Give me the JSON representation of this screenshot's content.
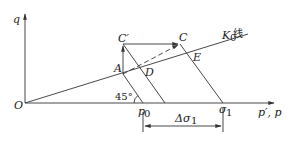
{
  "diagram": {
    "axes": {
      "y_label": "q",
      "x_label": "p′, p",
      "origin_label": "O"
    },
    "points": {
      "C_prime": "C′",
      "C": "C",
      "A": "A",
      "D": "D",
      "E": "E",
      "p0_base": "p",
      "p0_sub": "0",
      "sigma1_base": "σ",
      "sigma1_sub": "1"
    },
    "k0_line": {
      "label_base": "K",
      "label_sub": "0",
      "label_suffix": " 线"
    },
    "angle_label": "45°",
    "dimension": {
      "label_prefix": "Δσ",
      "label_sub": "1"
    }
  }
}
